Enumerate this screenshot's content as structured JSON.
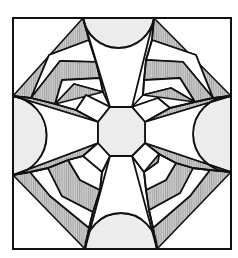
{
  "figure": {
    "colors": {
      "line": "#111111",
      "background": "#ffffff",
      "light_fill": "#ececec",
      "hatch_base": "#c8c8c8",
      "hatch_line": "#9a9a9a"
    },
    "frame": {
      "x": 13,
      "y": 18,
      "width": 218,
      "height": 231
    },
    "octagon_points": "110,107 132,107 145,122 145,143 132,156 110,156 98,143 98,122"
  }
}
